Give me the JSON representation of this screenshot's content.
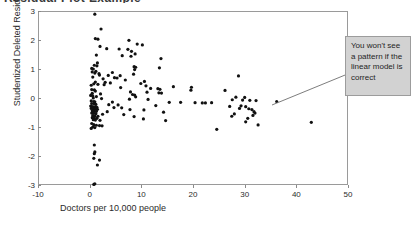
{
  "figure": {
    "title_remnant": "Residual Plot Example",
    "background_color": "#ffffff"
  },
  "annotation": {
    "text": "You won't see a pattern if the linear model is correct",
    "box_color": "#d2d2d2",
    "border_color": "#9c9c9c",
    "leader_line_color": "#6e6e6e"
  },
  "chart_data": {
    "type": "scatter",
    "title": "",
    "xlabel": "Doctors per 10,000 people",
    "ylabel": "Studentized Deleted Residual",
    "xlim": [
      -10,
      50
    ],
    "ylim": [
      -3,
      3
    ],
    "xticks": [
      -10,
      0,
      10,
      20,
      30,
      40,
      50
    ],
    "yticks": [
      -3,
      -2,
      -1,
      0,
      1,
      2,
      3
    ],
    "xticklabels": [
      "-10",
      "0",
      "10",
      "20",
      "30",
      "40",
      "50"
    ],
    "yticklabels": [
      "-3",
      "-2",
      "-1",
      "0",
      "1",
      "2",
      "3"
    ],
    "grid": false,
    "legend": null,
    "marker_color": "#111111",
    "marker_size": 1.6,
    "annotations": [
      {
        "text": "You won't see a pattern if the linear model is correct",
        "points_to_x": 27.5,
        "points_to_y": 0.05
      }
    ],
    "series": [
      {
        "name": "Studentized Deleted Residual",
        "points": [
          [
            1.0,
            2.89
          ],
          [
            2.2,
            2.38
          ],
          [
            1.1,
            2.05
          ],
          [
            1.6,
            2.03
          ],
          [
            7.6,
            1.99
          ],
          [
            9.2,
            1.86
          ],
          [
            10.2,
            1.83
          ],
          [
            2.0,
            1.78
          ],
          [
            3.3,
            1.7
          ],
          [
            5.7,
            1.69
          ],
          [
            7.4,
            1.68
          ],
          [
            8.1,
            1.61
          ],
          [
            8.8,
            1.52
          ],
          [
            1.3,
            1.48
          ],
          [
            6.3,
            1.46
          ],
          [
            8.0,
            1.44
          ],
          [
            13.8,
            1.36
          ],
          [
            1.5,
            1.21
          ],
          [
            0.9,
            1.13
          ],
          [
            1.4,
            1.11
          ],
          [
            8.6,
            1.08
          ],
          [
            8.9,
            1.06
          ],
          [
            13.5,
            1.04
          ],
          [
            0.4,
            1.02
          ],
          [
            0.7,
            1.0
          ],
          [
            8.7,
            0.98
          ],
          [
            1.2,
            0.92
          ],
          [
            0.5,
            0.9
          ],
          [
            4.4,
            0.88
          ],
          [
            1.0,
            0.86
          ],
          [
            1.8,
            0.84
          ],
          [
            8.5,
            0.82
          ],
          [
            1.9,
            0.79
          ],
          [
            3.6,
            0.78
          ],
          [
            5.9,
            0.77
          ],
          [
            28.8,
            0.76
          ],
          [
            0.6,
            0.72
          ],
          [
            4.8,
            0.7
          ],
          [
            5.3,
            0.69
          ],
          [
            2.6,
            0.66
          ],
          [
            6.9,
            0.62
          ],
          [
            10.6,
            0.57
          ],
          [
            1.1,
            0.55
          ],
          [
            3.0,
            0.54
          ],
          [
            4.0,
            0.52
          ],
          [
            9.9,
            0.5
          ],
          [
            0.8,
            0.49
          ],
          [
            1.6,
            0.47
          ],
          [
            2.8,
            0.46
          ],
          [
            0.3,
            0.44
          ],
          [
            10.9,
            0.42
          ],
          [
            16.2,
            0.39
          ],
          [
            19.7,
            0.37
          ],
          [
            6.0,
            0.36
          ],
          [
            11.8,
            0.33
          ],
          [
            13.2,
            0.32
          ],
          [
            13.6,
            0.3
          ],
          [
            0.4,
            0.29
          ],
          [
            0.9,
            0.28
          ],
          [
            19.6,
            0.27
          ],
          [
            26.2,
            0.26
          ],
          [
            1.1,
            0.24
          ],
          [
            7.9,
            0.21
          ],
          [
            11.1,
            0.2
          ],
          [
            13.4,
            0.18
          ],
          [
            13.9,
            0.17
          ],
          [
            0.5,
            0.16
          ],
          [
            2.1,
            0.14
          ],
          [
            8.3,
            0.12
          ],
          [
            8.7,
            0.1
          ],
          [
            0.2,
            0.09
          ],
          [
            0.6,
            0.07
          ],
          [
            1.3,
            0.05
          ],
          [
            8.9,
            0.04
          ],
          [
            28.3,
            0.03
          ],
          [
            30.0,
            0.02
          ],
          [
            0.7,
            0.0
          ],
          [
            2.3,
            -0.02
          ],
          [
            7.7,
            -0.04
          ],
          [
            11.3,
            -0.05
          ],
          [
            27.6,
            -0.06
          ],
          [
            29.6,
            -0.07
          ],
          [
            31.0,
            -0.08
          ],
          [
            32.2,
            -0.09
          ],
          [
            0.3,
            -0.1
          ],
          [
            0.8,
            -0.12
          ],
          [
            1.0,
            -0.13
          ],
          [
            4.4,
            -0.14
          ],
          [
            15.4,
            -0.15
          ],
          [
            17.6,
            -0.15
          ],
          [
            20.4,
            -0.16
          ],
          [
            21.8,
            -0.17
          ],
          [
            22.4,
            -0.17
          ],
          [
            23.6,
            -0.16
          ],
          [
            36.2,
            -0.12
          ],
          [
            0.4,
            -0.19
          ],
          [
            0.9,
            -0.2
          ],
          [
            1.2,
            -0.22
          ],
          [
            3.7,
            -0.23
          ],
          [
            5.5,
            -0.24
          ],
          [
            12.8,
            -0.26
          ],
          [
            29.3,
            -0.27
          ],
          [
            0.2,
            -0.28
          ],
          [
            0.6,
            -0.3
          ],
          [
            1.0,
            -0.31
          ],
          [
            1.4,
            -0.32
          ],
          [
            4.7,
            -0.33
          ],
          [
            6.2,
            -0.34
          ],
          [
            27.1,
            -0.29
          ],
          [
            30.2,
            -0.3
          ],
          [
            0.3,
            -0.36
          ],
          [
            0.7,
            -0.37
          ],
          [
            1.1,
            -0.38
          ],
          [
            1.5,
            -0.39
          ],
          [
            7.8,
            -0.4
          ],
          [
            10.5,
            -0.41
          ],
          [
            29.0,
            -0.36
          ],
          [
            30.8,
            -0.37
          ],
          [
            31.4,
            -0.4
          ],
          [
            0.5,
            -0.44
          ],
          [
            0.9,
            -0.45
          ],
          [
            1.3,
            -0.46
          ],
          [
            3.4,
            -0.47
          ],
          [
            14.3,
            -0.49
          ],
          [
            31.8,
            -0.47
          ],
          [
            0.4,
            -0.52
          ],
          [
            0.8,
            -0.53
          ],
          [
            1.2,
            -0.54
          ],
          [
            2.5,
            -0.56
          ],
          [
            6.6,
            -0.57
          ],
          [
            28.0,
            -0.55
          ],
          [
            32.0,
            -0.52
          ],
          [
            0.6,
            -0.61
          ],
          [
            1.0,
            -0.62
          ],
          [
            1.6,
            -0.63
          ],
          [
            8.6,
            -0.64
          ],
          [
            27.5,
            -0.63
          ],
          [
            31.6,
            -0.6
          ],
          [
            0.5,
            -0.68
          ],
          [
            0.9,
            -0.69
          ],
          [
            1.4,
            -0.7
          ],
          [
            10.4,
            -0.72
          ],
          [
            30.6,
            -0.7
          ],
          [
            0.7,
            -0.75
          ],
          [
            1.1,
            -0.76
          ],
          [
            2.0,
            -0.77
          ],
          [
            14.7,
            -0.78
          ],
          [
            30.2,
            -0.82
          ],
          [
            0.4,
            -0.88
          ],
          [
            0.8,
            -0.92
          ],
          [
            1.3,
            -0.94
          ],
          [
            1.9,
            -0.95
          ],
          [
            2.4,
            -0.96
          ],
          [
            32.6,
            -0.93
          ],
          [
            0.6,
            -1.0
          ],
          [
            1.0,
            -1.02
          ],
          [
            0.3,
            -1.05
          ],
          [
            24.6,
            -1.08
          ],
          [
            42.9,
            -0.84
          ],
          [
            0.9,
            -1.62
          ],
          [
            1.0,
            -1.86
          ],
          [
            0.9,
            -1.92
          ],
          [
            0.8,
            -2.08
          ],
          [
            1.9,
            -2.14
          ],
          [
            1.5,
            -2.31
          ],
          [
            0.8,
            -2.98
          ],
          [
            1.0,
            -2.96
          ]
        ]
      }
    ]
  }
}
